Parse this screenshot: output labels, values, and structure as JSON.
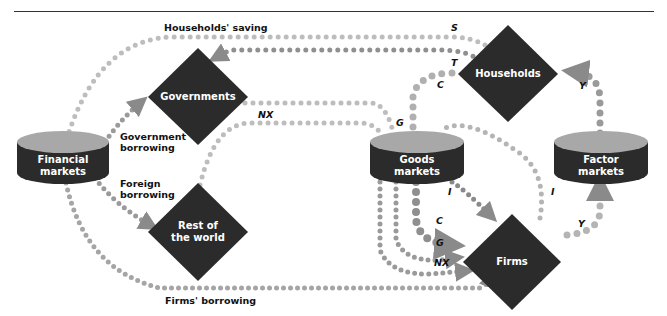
{
  "title_rule": true,
  "nodes": {
    "financial_markets": {
      "label_line1": "Financial",
      "label_line2": "markets"
    },
    "goods_markets": {
      "label_line1": "Goods",
      "label_line2": "markets"
    },
    "factor_markets": {
      "label_line1": "Factor",
      "label_line2": "markets"
    },
    "governments": {
      "label": "Governments"
    },
    "households": {
      "label": "Households"
    },
    "rest_of_world": {
      "label_line1": "Rest of",
      "label_line2": "the world"
    },
    "firms": {
      "label": "Firms"
    }
  },
  "flow_labels": {
    "households_saving": "Households' saving",
    "government_borrowing_1": "Government",
    "government_borrowing_2": "borrowing",
    "foreign_borrowing_1": "Foreign",
    "foreign_borrowing_2": "borrowing",
    "firms_borrowing": "Firms' borrowing",
    "S": "S",
    "T": "T",
    "C_top": "C",
    "Y_top": "Y",
    "G_top": "G",
    "NX_top": "NX",
    "I_left": "I",
    "I_right": "I",
    "C_bottom": "C",
    "G_bottom": "G",
    "NX_bottom": "NX",
    "Y_bottom": "Y"
  },
  "colors": {
    "node_fill": "#2b2b2b",
    "cylinder_top": "#a8a8a8",
    "dot_light": "#bdbdbd",
    "dot_mid": "#9a9a9a",
    "dot_dark": "#7a7a7a",
    "text": "#111111"
  }
}
